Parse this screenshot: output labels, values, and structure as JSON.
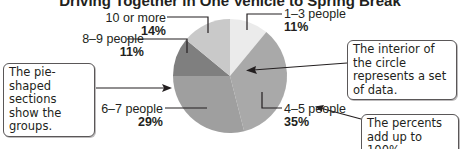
{
  "chart_data": {
    "type": "pie",
    "title": "Driving Together in One Vehicle to Spring Break",
    "categories": [
      "1–3 people",
      "4–5 people",
      "6–7 people",
      "8–9 people",
      "10 or more"
    ],
    "values": [
      11,
      35,
      29,
      11,
      14
    ],
    "value_labels": [
      "11%",
      "35%",
      "29%",
      "11%",
      "14%"
    ],
    "units": "%",
    "start_angle": "12 o'clock, clockwise",
    "colors": [
      "#ebebeb",
      "#a9a9a9",
      "#9f9f9f",
      "#7f7f7f",
      "#c9c9c9"
    ],
    "legend": "none (direct labels)",
    "annotations": [
      "The pie-shaped sections show the groups.",
      "The interior of the circle represents a set of data.",
      "The percents add up to 100%."
    ]
  },
  "title": "Driving Together in One Vehicle to Spring Break",
  "labels": {
    "s1": {
      "name": "1–3 people",
      "pct": "11%"
    },
    "s2": {
      "name": "4–5 people",
      "pct": "35%"
    },
    "s3": {
      "name": "6–7 people",
      "pct": "29%"
    },
    "s4": {
      "name": "8–9 people",
      "pct": "11%"
    },
    "s5": {
      "name": "10 or more",
      "pct": "14%"
    }
  },
  "callouts": {
    "groups": "The pie-shaped sections show the groups.",
    "interior": "The interior of the circle represents a set of data.",
    "percents": "The percents add up to 100%."
  }
}
